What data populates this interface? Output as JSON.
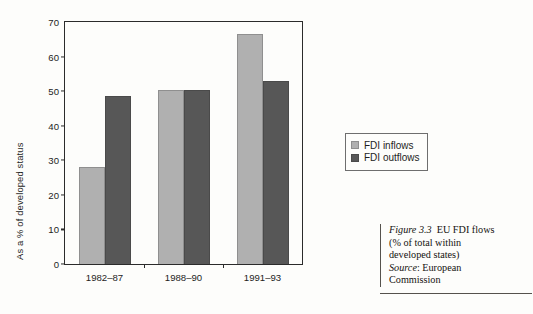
{
  "chart_data": {
    "type": "bar",
    "title": "",
    "xlabel": "",
    "ylabel": "As a % of developed status",
    "ylim": [
      0,
      70
    ],
    "ytick_step": 10,
    "yticks": [
      0,
      10,
      20,
      30,
      40,
      50,
      60,
      70
    ],
    "categories": [
      "1982–87",
      "1988–90",
      "1991–93"
    ],
    "grid": false,
    "legend_position": "right",
    "series": [
      {
        "name": "FDI inflows",
        "color": "#b0b0b0",
        "values": [
          28.0,
          50.2,
          66.5
        ]
      },
      {
        "name": "FDI outflows",
        "color": "#575757",
        "values": [
          48.5,
          50.4,
          53.0
        ]
      }
    ]
  },
  "legend": {
    "entries": [
      {
        "label": "FDI inflows"
      },
      {
        "label": "FDI outflows"
      }
    ]
  },
  "caption": {
    "figure_number": "Figure 3.3",
    "figure_title": "EU FDI flows",
    "line2": "(% of total within",
    "line3": "developed states)",
    "source_label": "Source",
    "source_sep": ": European",
    "source_line2": "Commission"
  },
  "colors": {
    "inflow": "#b0b0b0",
    "outflow": "#575757",
    "axis": "#2b2b2b",
    "page": "#fdfdfb"
  }
}
